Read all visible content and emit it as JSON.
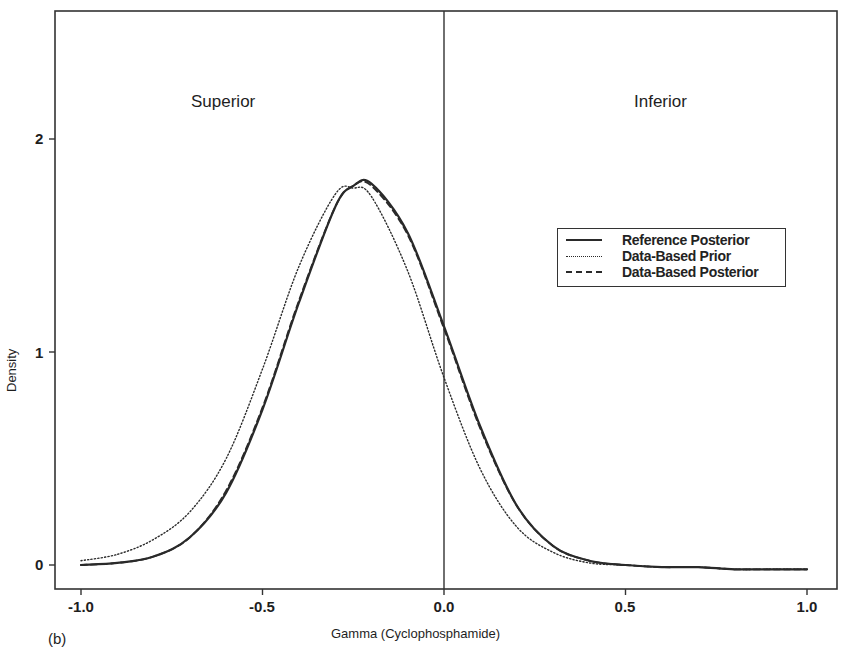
{
  "chart_data": {
    "type": "line",
    "title": "",
    "panel_label": "(b)",
    "xlabel": "Gamma (Cyclophosphamide)",
    "ylabel": "Density",
    "xlim": [
      -1.0,
      1.0
    ],
    "ylim": [
      0,
      2
    ],
    "x_ticks": [
      "-1.0",
      "-0.5",
      "0.0",
      "0.5",
      "1.0"
    ],
    "y_ticks": [
      "0",
      "1",
      "2"
    ],
    "grid": false,
    "legend_position": "right-middle",
    "annotations": [
      {
        "text": "Superior",
        "x": -0.5,
        "y": 2.2
      },
      {
        "text": "Inferior",
        "x": 0.55,
        "y": 2.2
      }
    ],
    "reference_line": {
      "x": 0.0,
      "style": "solid"
    },
    "x": [
      -1.0,
      -0.9,
      -0.8,
      -0.7,
      -0.6,
      -0.5,
      -0.4,
      -0.3,
      -0.25,
      -0.2,
      -0.1,
      0.0,
      0.1,
      0.2,
      0.3,
      0.4,
      0.5,
      0.6,
      0.7,
      0.8,
      0.9,
      1.0
    ],
    "series": [
      {
        "name": "Reference Posterior",
        "style": "solid",
        "values": [
          0.0,
          0.01,
          0.04,
          0.13,
          0.34,
          0.73,
          1.23,
          1.68,
          1.78,
          1.79,
          1.56,
          1.12,
          0.65,
          0.28,
          0.09,
          0.02,
          0.0,
          -0.01,
          -0.01,
          -0.02,
          -0.02,
          -0.02
        ]
      },
      {
        "name": "Data-Based Prior",
        "style": "dotted",
        "values": [
          0.02,
          0.05,
          0.12,
          0.25,
          0.5,
          0.92,
          1.4,
          1.74,
          1.77,
          1.73,
          1.38,
          0.88,
          0.45,
          0.18,
          0.06,
          0.01,
          0.0,
          -0.01,
          -0.01,
          -0.02,
          -0.02,
          -0.02
        ]
      },
      {
        "name": "Data-Based Posterior",
        "style": "dashed",
        "values": [
          0.0,
          0.01,
          0.04,
          0.13,
          0.35,
          0.74,
          1.24,
          1.68,
          1.78,
          1.78,
          1.55,
          1.11,
          0.64,
          0.28,
          0.09,
          0.02,
          0.0,
          -0.01,
          -0.01,
          -0.02,
          -0.02,
          -0.02
        ]
      }
    ]
  },
  "labels": {
    "superior": "Superior",
    "inferior": "Inferior",
    "xlabel": "Gamma (Cyclophosphamide)",
    "ylabel": "Density",
    "panel": "(b)",
    "yticks": [
      "0",
      "1",
      "2"
    ],
    "xticks": [
      "-1.0",
      "-0.5",
      "0.0",
      "0.5",
      "1.0"
    ]
  },
  "legend": {
    "items": [
      {
        "label": "Reference Posterior",
        "style": "solid"
      },
      {
        "label": "Data-Based Prior",
        "style": "dotted"
      },
      {
        "label": "Data-Based Posterior",
        "style": "dashed"
      }
    ]
  },
  "colors": {
    "line": "#2a2a2a",
    "frame": "#333333",
    "background": "#ffffff"
  }
}
